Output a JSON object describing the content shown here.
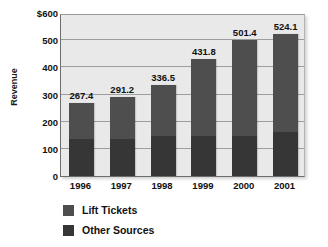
{
  "chart_data": {
    "type": "bar",
    "title": "",
    "subtitle": "",
    "xlabel": "",
    "ylabel": "Revenue",
    "categories": [
      "1996",
      "1997",
      "1998",
      "1999",
      "2000",
      "2001"
    ],
    "totals": [
      "267.4",
      "291.2",
      "336.5",
      "431.8",
      "501.4",
      "524.1"
    ],
    "series": [
      {
        "name": "Other Sources",
        "color": "#363636",
        "values": [
          136,
          138,
          148,
          146,
          148,
          163
        ]
      },
      {
        "name": "Lift Tickets",
        "color": "#4e4e4e",
        "values": [
          131.4,
          153.2,
          188.5,
          285.8,
          353.4,
          361.1
        ]
      }
    ],
    "ylim": [
      0,
      600
    ],
    "ytick_values": [
      600,
      500,
      400,
      300,
      200,
      100,
      0
    ],
    "ytick_labels": [
      "$600",
      "500",
      "400",
      "300",
      "200",
      "100",
      "0"
    ],
    "grid": true,
    "legend_position": "bottom-left",
    "stacked": true,
    "plot_background": "#e9e9e9",
    "gridline_color": "#9d9d9d"
  },
  "legend": {
    "items": [
      {
        "label": "Lift Tickets",
        "color": "#4e4e4e"
      },
      {
        "label": "Other Sources",
        "color": "#363636"
      }
    ]
  }
}
